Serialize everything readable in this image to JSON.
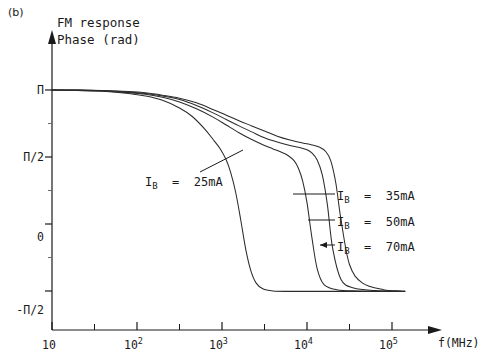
{
  "panel": {
    "label": "(b)"
  },
  "axis_titles": {
    "y_line1": "FM response",
    "y_line2": "Phase (rad)",
    "x_name": "f(MHz)"
  },
  "y_ticks": [
    {
      "label": "Π",
      "value": 3.1416
    },
    {
      "label": "Π/2",
      "value": 1.5708
    },
    {
      "label": "0",
      "value": 0
    },
    {
      "label": "-Π/2",
      "value": -1.5708
    }
  ],
  "x_ticks": [
    {
      "mantissa": "10",
      "exponent": "",
      "value": 1
    },
    {
      "mantissa": "10",
      "exponent": "2",
      "value": 2
    },
    {
      "mantissa": "10",
      "exponent": "3",
      "value": 3
    },
    {
      "mantissa": "10",
      "exponent": "4",
      "value": 4
    },
    {
      "mantissa": "10",
      "exponent": "5",
      "value": 5
    }
  ],
  "annotations": [
    {
      "id": "ib25",
      "text": "I",
      "sub": "B",
      "rest": "  =  25mA"
    },
    {
      "id": "ib35",
      "text": "I",
      "sub": "B",
      "rest": "  =  35mA"
    },
    {
      "id": "ib50",
      "text": "I",
      "sub": "B",
      "rest": "  =  50mA"
    },
    {
      "id": "ib70",
      "text": "I",
      "sub": "B",
      "rest": "  =  70mA"
    }
  ],
  "colors": {
    "ink": "#1a1a1a",
    "curve": "#2b2b2b",
    "background": "#ffffff"
  },
  "chart_data": {
    "type": "line",
    "subtitle": "(b)",
    "xlabel": "f(MHz)",
    "ylabel": "FM response Phase (rad)",
    "x_scale": "log",
    "xlim": [
      1,
      5.5
    ],
    "ylim": [
      -2.2,
      3.6
    ],
    "grid": false,
    "legend_position": "inline-annotations",
    "y_tick_labels": [
      "Π",
      "Π/2",
      "0",
      "-Π/2"
    ],
    "y_tick_values": [
      3.1416,
      1.5708,
      0,
      -1.5708
    ],
    "x_tick_labels": [
      "10",
      "10^2",
      "10^3",
      "10^4",
      "10^5"
    ],
    "x_tick_values": [
      1,
      2,
      3,
      4,
      5
    ],
    "series": [
      {
        "name": "I_B = 25mA",
        "bias_current_mA": 25,
        "x_log": [
          1.0,
          1.3,
          1.6,
          1.9,
          2.1,
          2.3,
          2.5,
          2.65,
          2.8,
          2.9,
          2.98,
          3.05,
          3.1,
          3.16,
          3.22,
          3.28,
          3.34,
          3.4,
          3.48,
          3.6,
          3.8,
          4.1,
          4.5,
          5.0,
          5.15
        ],
        "y": [
          3.14,
          3.13,
          3.11,
          3.06,
          3.0,
          2.9,
          2.72,
          2.52,
          2.22,
          1.97,
          1.76,
          1.5,
          1.22,
          0.75,
          0.1,
          -0.6,
          -1.1,
          -1.38,
          -1.52,
          -1.57,
          -1.58,
          -1.58,
          -1.58,
          -1.58,
          -1.58
        ]
      },
      {
        "name": "I_B = 35mA",
        "bias_current_mA": 35,
        "x_log": [
          1.0,
          1.3,
          1.6,
          1.9,
          2.1,
          2.3,
          2.5,
          2.7,
          2.9,
          3.05,
          3.2,
          3.35,
          3.5,
          3.6,
          3.7,
          3.78,
          3.85,
          3.9,
          3.95,
          4.0,
          4.06,
          4.12,
          4.2,
          4.35,
          4.6,
          5.0,
          5.15
        ],
        "y": [
          3.14,
          3.135,
          3.12,
          3.08,
          3.04,
          2.97,
          2.86,
          2.7,
          2.5,
          2.32,
          2.14,
          1.98,
          1.84,
          1.76,
          1.68,
          1.6,
          1.48,
          1.3,
          1.0,
          0.5,
          -0.35,
          -1.05,
          -1.42,
          -1.54,
          -1.57,
          -1.58,
          -1.58
        ]
      },
      {
        "name": "I_B = 50mA",
        "bias_current_mA": 50,
        "x_log": [
          1.0,
          1.3,
          1.6,
          1.9,
          2.1,
          2.3,
          2.5,
          2.7,
          2.9,
          3.05,
          3.2,
          3.35,
          3.5,
          3.65,
          3.8,
          3.9,
          4.0,
          4.06,
          4.12,
          4.18,
          4.24,
          4.3,
          4.4,
          4.55,
          4.8,
          5.1,
          5.15
        ],
        "y": [
          3.14,
          3.14,
          3.125,
          3.095,
          3.06,
          3.0,
          2.92,
          2.78,
          2.6,
          2.45,
          2.3,
          2.16,
          2.02,
          1.92,
          1.84,
          1.8,
          1.74,
          1.66,
          1.5,
          1.15,
          0.45,
          -0.55,
          -1.3,
          -1.5,
          -1.56,
          -1.58,
          -1.58
        ]
      },
      {
        "name": "I_B = 70mA",
        "bias_current_mA": 70,
        "x_log": [
          1.0,
          1.3,
          1.6,
          1.9,
          2.1,
          2.3,
          2.5,
          2.7,
          2.9,
          3.05,
          3.2,
          3.35,
          3.5,
          3.65,
          3.8,
          3.95,
          4.05,
          4.15,
          4.22,
          4.28,
          4.34,
          4.4,
          4.5,
          4.65,
          4.9,
          5.1,
          5.15
        ],
        "y": [
          3.14,
          3.142,
          3.13,
          3.105,
          3.075,
          3.02,
          2.95,
          2.84,
          2.68,
          2.55,
          2.42,
          2.3,
          2.18,
          2.06,
          1.97,
          1.9,
          1.86,
          1.8,
          1.7,
          1.48,
          0.95,
          0.1,
          -0.95,
          -1.38,
          -1.54,
          -1.57,
          -1.58
        ]
      }
    ]
  }
}
